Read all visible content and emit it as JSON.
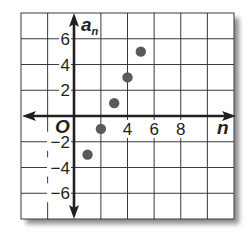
{
  "chart_data": {
    "type": "scatter",
    "title": "",
    "xlabel": "n",
    "ylabel": "a_n",
    "ylabel_main": "a",
    "ylabel_sub": "n",
    "origin_label": "O",
    "xlim": [
      -4,
      12
    ],
    "ylim": [
      -8,
      8
    ],
    "grid": true,
    "grid_step": 2,
    "x_ticks": [
      {
        "value": 4,
        "label": "4"
      },
      {
        "value": 6,
        "label": "6"
      },
      {
        "value": 8,
        "label": "8"
      }
    ],
    "y_ticks": [
      {
        "value": 6,
        "label": "6"
      },
      {
        "value": 4,
        "label": "4"
      },
      {
        "value": 2,
        "label": "2"
      },
      {
        "value": -2,
        "label": "−2"
      },
      {
        "value": -4,
        "label": "−4"
      },
      {
        "value": -6,
        "label": "−6"
      }
    ],
    "series": [
      {
        "name": "a_n",
        "x": [
          1,
          2,
          3,
          4,
          5
        ],
        "y": [
          -3,
          -1,
          1,
          3,
          5
        ]
      }
    ],
    "colors": {
      "grid": "#3a3a3a",
      "axis": "#231f20",
      "point": "#5a5a5a",
      "shadow": "#9a9a9a"
    }
  }
}
